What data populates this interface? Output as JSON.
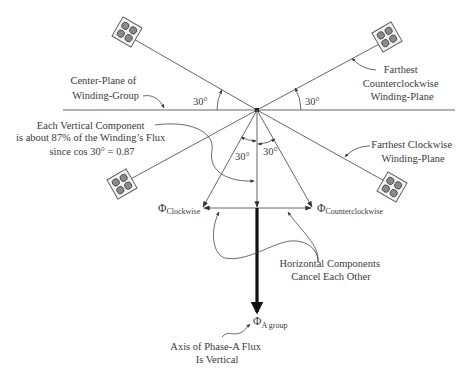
{
  "diagram": {
    "labels": {
      "center_plane": [
        "Center-Plane of",
        "Winding-Group"
      ],
      "farthest_ccw": [
        "Farthest",
        "Counterclockwise",
        "Winding-Plane"
      ],
      "farthest_cw": [
        "Farthest Clockwise",
        "Winding-Plane"
      ],
      "vertical_component": [
        "Each Vertical Component",
        "is about 87% of the Winding’s Flux",
        "since cos 30° = 0.87"
      ],
      "horizontal_components": [
        "Horizontal Components",
        "Cancel Each Other"
      ],
      "axis_phase_a": [
        "Axis of Phase-A Flux",
        "Is Vertical"
      ]
    },
    "angles": {
      "upper_left": "30°",
      "upper_right": "30°",
      "lower_left": "30°",
      "lower_right": "30°"
    },
    "vectors": {
      "clockwise": {
        "symbol": "Φ",
        "subscript": "Clockwise"
      },
      "counterclockwise": {
        "symbol": "Φ",
        "subscript": "Counterclockwise"
      },
      "resultant": {
        "symbol": "Φ",
        "subscript": "A group"
      }
    },
    "colors": {
      "line": "#555555",
      "text": "#3a3a3a",
      "coil_dot": "#8a8a8a",
      "resultant": "#111111"
    }
  }
}
